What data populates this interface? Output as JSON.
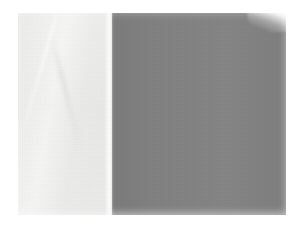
{
  "image": {
    "kind": "photograph",
    "subject": "two-tone paper sample",
    "background_color": "#ffffff",
    "alt_text": "Photograph of a rectangular two-tone paper sample: a pale off-white left portion and a medium gray right portion, on a plain white background.",
    "frame": {
      "width_px": 290,
      "height_px": 238
    },
    "sample_bounds": {
      "left_px": 18,
      "top_px": 13,
      "width_px": 268,
      "height_px": 202
    },
    "regions": [
      {
        "name": "light-field",
        "label": "Off-white field",
        "color": "#e8e8e6",
        "x_start_px": 18,
        "x_end_px": 112,
        "share_percent": 35
      },
      {
        "name": "dark-field",
        "label": "Medium gray field",
        "color": "#808080",
        "x_start_px": 112,
        "x_end_px": 286,
        "share_percent": 65
      }
    ],
    "features": [
      {
        "name": "diagonal-crease",
        "label": "Faint diagonal crease in the pale field"
      },
      {
        "name": "tone-boundary",
        "label": "Vertical tone boundary with a bright highlight strip",
        "x_px": 112
      },
      {
        "name": "corner-lift",
        "label": "Lighter lifted wedge at the top-right corner"
      }
    ]
  }
}
